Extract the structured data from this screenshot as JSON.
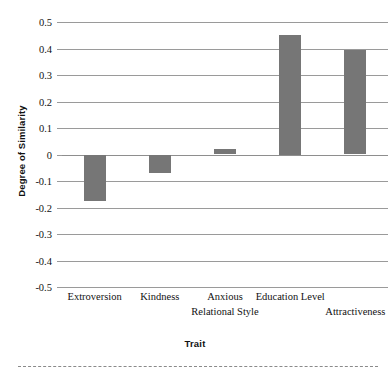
{
  "chart_data": {
    "type": "bar",
    "title": "",
    "xlabel": "Trait",
    "ylabel": "Degree of Similarity",
    "categories": [
      "Extroversion",
      "Kindness",
      "Anxious Relational Style",
      "Education Level",
      "Attractiveness"
    ],
    "category_lines": [
      [
        "Extroversion",
        ""
      ],
      [
        "Kindness",
        ""
      ],
      [
        "Anxious",
        "Relational Style"
      ],
      [
        "Education Level",
        ""
      ],
      [
        "",
        "Attractiveness"
      ]
    ],
    "values": [
      -0.175,
      -0.07,
      0.02,
      0.45,
      0.395
    ],
    "ylim": [
      -0.5,
      0.5
    ],
    "ytick_labels": [
      "0.5",
      "0.4",
      "0.3",
      "0.2",
      "0.1",
      "0",
      "-0.1",
      "-0.2",
      "-0.3",
      "-0.4",
      "-0.5"
    ],
    "ytick_values": [
      0.5,
      0.4,
      0.3,
      0.2,
      0.1,
      0,
      -0.1,
      -0.2,
      -0.3,
      -0.4,
      -0.5
    ],
    "grid": true,
    "legend": "none",
    "bar_color": "#767676",
    "gridline_color": "#9a9a9a"
  },
  "axis": {
    "y_title": "Degree of Similarity",
    "x_title": "Trait"
  }
}
